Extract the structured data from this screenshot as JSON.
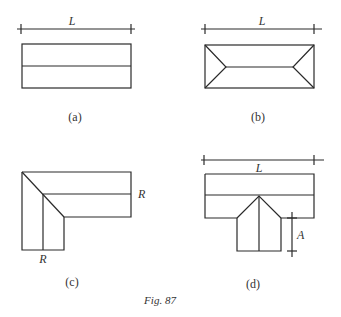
{
  "figure": {
    "caption": "Fig. 87",
    "panels": [
      {
        "id": "a",
        "label": "(a)",
        "description": "Gable roof plan: rectangle with central ridge line",
        "dimension_label": "L"
      },
      {
        "id": "b",
        "label": "(b)",
        "description": "Hip roof plan: rectangle with hips meeting a shortened ridge",
        "dimension_label": "L"
      },
      {
        "id": "c",
        "label": "(c)",
        "description": "L-shaped roof plan with valley diagonal and two ridges",
        "dimension_labels": [
          "R",
          "R"
        ]
      },
      {
        "id": "d",
        "label": "(d)",
        "description": "T-shaped roof plan with main ridge and intersecting wing",
        "dimension_labels": [
          "L",
          "A"
        ]
      }
    ]
  },
  "colors": {
    "line": "#2a2a2a",
    "text": "#333333",
    "background": "#ffffff"
  }
}
